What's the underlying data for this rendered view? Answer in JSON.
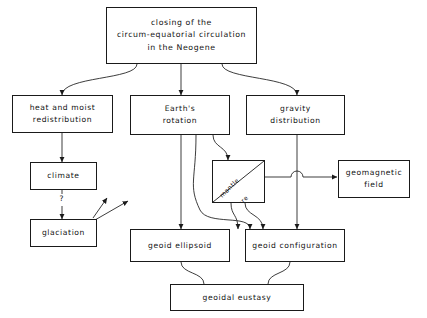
{
  "diagram": {
    "type": "flowchart",
    "title_box": {
      "name": "closing-of-circum-equatorial-circulation",
      "lines": [
        "closing of the",
        "circum-equatorial circulation",
        "in the Neogene"
      ]
    },
    "nodes": [
      {
        "id": "heat",
        "lines": [
          "heat and moist",
          "redistribution"
        ]
      },
      {
        "id": "rotation",
        "lines": [
          "Earth's",
          "rotation"
        ]
      },
      {
        "id": "gravity",
        "lines": [
          "gravity",
          "distribution"
        ]
      },
      {
        "id": "climate",
        "lines": [
          "climate"
        ]
      },
      {
        "id": "glaciation",
        "lines": [
          "glaciation"
        ]
      },
      {
        "id": "mantle_core",
        "lines": [
          "mantle",
          "core"
        ]
      },
      {
        "id": "geomagnetic",
        "lines": [
          "geomagnetic",
          "field"
        ]
      },
      {
        "id": "geoid_ellipsoid",
        "lines": [
          "geoid ellipsoid"
        ]
      },
      {
        "id": "geoid_configuration",
        "lines": [
          "geoid configuration"
        ]
      },
      {
        "id": "geoidal_eustasy",
        "lines": [
          "geoidal eustasy"
        ]
      }
    ],
    "edge_labels": {
      "climate_to_glaciation": "?"
    },
    "colors": {
      "line": "#1a1a1a",
      "text": "#111111",
      "background": "#ffffff"
    }
  }
}
